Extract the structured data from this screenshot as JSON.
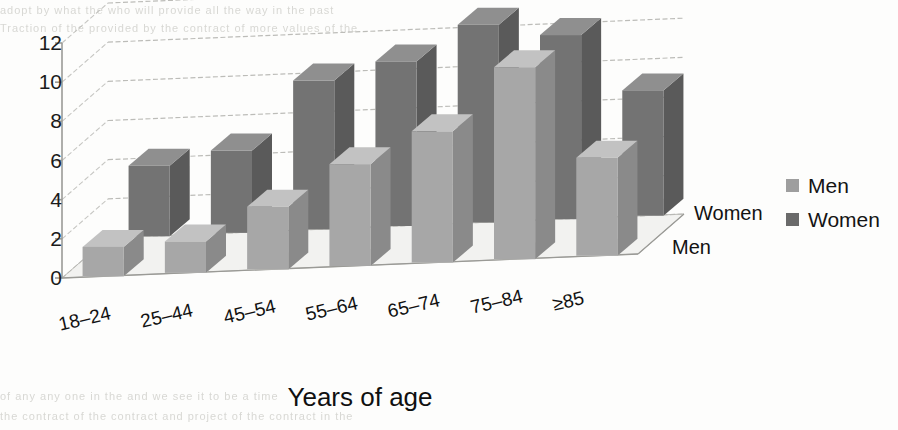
{
  "chart_data": {
    "type": "bar",
    "render": "3d-grouped-bar",
    "title": "",
    "xlabel": "Years of age",
    "ylabel": "",
    "categories": [
      "18–24",
      "25–44",
      "45–54",
      "55–64",
      "65–74",
      "75–84",
      "≥85"
    ],
    "series": [
      {
        "name": "Men",
        "color": "#9e9e9e",
        "values": [
          1.5,
          1.6,
          3.2,
          5.2,
          6.7,
          9.8,
          5.0
        ]
      },
      {
        "name": "Women",
        "color": "#6a6a6a",
        "values": [
          3.6,
          4.2,
          7.6,
          8.4,
          10.1,
          9.4,
          6.4
        ]
      }
    ],
    "yticks": [
      0,
      2,
      4,
      6,
      8,
      10,
      12
    ],
    "ylim": [
      0,
      12
    ],
    "grid": true,
    "legend_position": "right",
    "depth_axis_labels": [
      "Women",
      "Men"
    ]
  },
  "axes": {
    "y_tick_labels": [
      "12",
      "10",
      "8",
      "6",
      "4",
      "2",
      "0"
    ],
    "x_title": "Years of age",
    "category_labels": [
      "18–24",
      "25–44",
      "45–54",
      "55–64",
      "65–74",
      "75–84",
      "≥85"
    ],
    "depth_label_back": "Women",
    "depth_label_front": "Men"
  },
  "legend": {
    "items": [
      {
        "label": "Men",
        "color": "#9e9e9e"
      },
      {
        "label": "Women",
        "color": "#6a6a6a"
      }
    ]
  },
  "palette": {
    "men_front": "#a7a7a7",
    "men_top": "#c2c2c2",
    "men_side": "#8a8a8a",
    "women_front": "#737373",
    "women_top": "#8f8f8f",
    "women_side": "#5a5a5a",
    "floor": "#f2f2f0",
    "grid": "#b9b9b5",
    "axis": "#9a9a96",
    "text": "#141414",
    "background": "#fdfdfc"
  },
  "artifacts": {
    "bleed_top": "adopt by what the   who will provide all the way in the past",
    "bleed_top2": "Traction of the provided by the contract of more values of the",
    "bleed_bottom": "of any any one  in the and   we  see   it  to  be  a  time",
    "bleed_bottom2": "the contract of the contract and project of the contract in the"
  }
}
